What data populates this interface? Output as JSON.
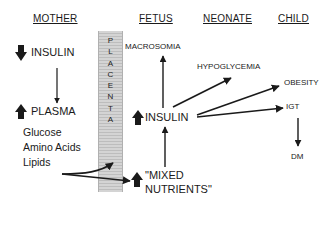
{
  "columns": {
    "mother": "MOTHER",
    "fetus": "FETUS",
    "neonate": "NEONATE",
    "child": "CHILD"
  },
  "mother": {
    "insulin": "INSULIN",
    "insulin_direction": "down",
    "plasma": "PLASMA",
    "plasma_direction": "up",
    "nutrients": [
      "Glucose",
      "Amino Acids",
      "Lipids"
    ]
  },
  "placenta": {
    "label": "PLACENTA",
    "letters": [
      "P",
      "L",
      "A",
      "C",
      "E",
      "N",
      "T",
      "A"
    ]
  },
  "fetus": {
    "macrosomia": "MACROSOMIA",
    "insulin": "INSULIN",
    "insulin_direction": "up",
    "mixed_nutrients_line1": "\"MIXED",
    "mixed_nutrients_line2": "NUTRIENTS\"",
    "mixed_nutrients_direction": "up"
  },
  "neonate": {
    "hypoglycemia": "HYPOGLYCEMIA"
  },
  "child": {
    "obesity": "OBESITY",
    "igt": "IGT",
    "dm": "DM"
  },
  "colors": {
    "ink": "#1a1a1a",
    "placenta_fill": "#cfcfcf",
    "background": "#ffffff"
  }
}
